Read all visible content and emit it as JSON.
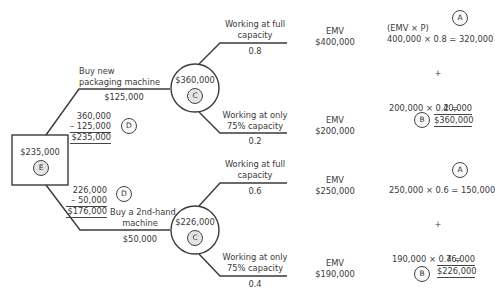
{
  "diagram": {
    "root": {
      "type": "decision",
      "value": "$235,000",
      "badge": "E"
    },
    "branches": [
      {
        "label_line1": "Buy new",
        "label_line2": "packaging machine",
        "cost": "$125,000",
        "calc": {
          "line1": "360,000",
          "line2": "– 125,000",
          "result": "$235,000",
          "badge": "D"
        },
        "chance_node": {
          "value": "$360,000",
          "badge": "C"
        },
        "outcomes": [
          {
            "label_line1": "Working at full",
            "label_line2": "capacity",
            "probability": "0.8",
            "emv_label": "EMV",
            "emv": "$400,000"
          },
          {
            "label_line1": "Working at only",
            "label_line2": "75% capacity",
            "probability": "0.2",
            "emv_label": "EMV",
            "emv": "$200,000"
          }
        ],
        "computation": {
          "header": "(EMV × P)",
          "line_a": "400,000 × 0.8 = 320,000",
          "badge_a": "A",
          "plus": "+",
          "line_b": "200,000 × 0.2 =",
          "line_b_value": "40,000",
          "total": "$360,000",
          "badge_b": "B"
        }
      },
      {
        "label_line1": "Buy a 2nd-hand",
        "label_line2": "machine",
        "cost": "$50,000",
        "calc": {
          "line1": "226,000",
          "line2": "–  50,000",
          "result": "$176,000",
          "badge": "D"
        },
        "chance_node": {
          "value": "$226,000",
          "badge": "C"
        },
        "outcomes": [
          {
            "label_line1": "Working at full",
            "label_line2": "capacity",
            "probability": "0.6",
            "emv_label": "EMV",
            "emv": "$250,000"
          },
          {
            "label_line1": "Working at only",
            "label_line2": "75% capacity",
            "probability": "0.4",
            "emv_label": "EMV",
            "emv": "$190,000"
          }
        ],
        "computation": {
          "line_a": "250,000 × 0.6 = 150,000",
          "badge_a": "A",
          "plus": "+",
          "line_b": "190,000 × 0.4 =",
          "line_b_value": "76,000",
          "total": "$226,000",
          "badge_b": "B"
        }
      }
    ]
  }
}
